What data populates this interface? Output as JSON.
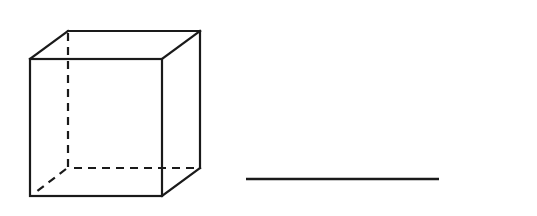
{
  "diagram": {
    "title": "",
    "figures": [
      {
        "kind": "cube",
        "description": "wireframe cube with hidden edges dashed"
      },
      {
        "kind": "line-segment",
        "description": "horizontal line segment"
      }
    ],
    "colors": {
      "stroke": "#1a1a1a",
      "background": "#ffffff"
    }
  }
}
